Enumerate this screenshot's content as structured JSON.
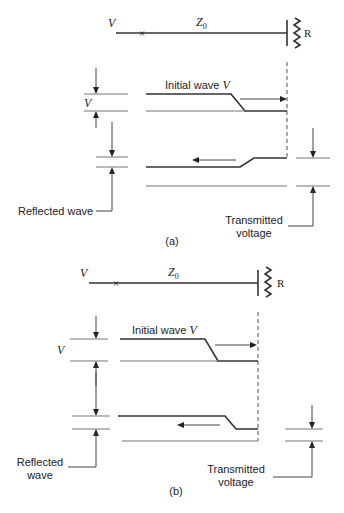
{
  "figure": {
    "panels": [
      {
        "id": "a",
        "caption": "(a)",
        "line": {
          "source_label": "V",
          "impedance_label": "Z",
          "impedance_subscript": "0",
          "load_label": "R",
          "fault_marker": "×"
        },
        "initial_wave_label": "Initial wave ",
        "initial_wave_symbol": "V",
        "v_marker_label": "V",
        "reflected_label": "Reflected wave",
        "transmitted_label_line1": "Transmitted",
        "transmitted_label_line2": "voltage",
        "reflected_step": "increase"
      },
      {
        "id": "b",
        "caption": "(b)",
        "line": {
          "source_label": "V",
          "impedance_label": "Z",
          "impedance_subscript": "0",
          "load_label": "R",
          "fault_marker": "×"
        },
        "initial_wave_label": "Initial wave ",
        "initial_wave_symbol": "V",
        "v_marker_label": "V",
        "reflected_label_line1": "Reflected",
        "reflected_label_line2": "wave",
        "transmitted_label_line1": "Transmitted",
        "transmitted_label_line2": "voltage",
        "reflected_step": "decrease"
      }
    ]
  }
}
